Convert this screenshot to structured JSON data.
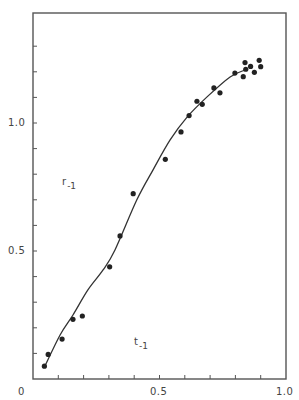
{
  "chart_data": {
    "type": "scatter",
    "title": "",
    "xlabel": "",
    "ylabel": "",
    "xlim": [
      0,
      1.0
    ],
    "ylim": [
      0,
      1.4
    ],
    "grid": false,
    "legend": null,
    "x_tick_labels": [
      {
        "value": 0,
        "label": "0"
      },
      {
        "value": 0.5,
        "label": "0.5"
      },
      {
        "value": 1.0,
        "label": "1.0"
      }
    ],
    "y_tick_labels": [
      {
        "value": 0.5,
        "label": "0.5"
      },
      {
        "value": 1.0,
        "label": "1.0"
      }
    ],
    "x_minor_ticks": [
      0.1,
      0.2,
      0.3,
      0.4,
      0.5,
      0.6,
      0.7,
      0.8,
      0.9
    ],
    "y_minor_ticks": [
      0.1,
      0.2,
      0.3,
      0.4,
      0.5,
      0.6,
      0.7,
      0.8,
      0.9,
      1.0,
      1.1,
      1.2,
      1.3
    ],
    "series": [
      {
        "name": "observed",
        "type": "scatter",
        "points": [
          [
            0.045,
            0.05
          ],
          [
            0.06,
            0.096
          ],
          [
            0.115,
            0.156
          ],
          [
            0.158,
            0.233
          ],
          [
            0.195,
            0.246
          ],
          [
            0.303,
            0.438
          ],
          [
            0.344,
            0.559
          ],
          [
            0.396,
            0.724
          ],
          [
            0.523,
            0.858
          ],
          [
            0.585,
            0.965
          ],
          [
            0.617,
            1.029
          ],
          [
            0.648,
            1.085
          ],
          [
            0.669,
            1.073
          ],
          [
            0.715,
            1.137
          ],
          [
            0.739,
            1.118
          ],
          [
            0.798,
            1.195
          ],
          [
            0.831,
            1.181
          ],
          [
            0.838,
            1.236
          ],
          [
            0.841,
            1.21
          ],
          [
            0.86,
            1.221
          ],
          [
            0.875,
            1.198
          ],
          [
            0.894,
            1.245
          ],
          [
            0.9,
            1.22
          ]
        ]
      },
      {
        "name": "fitted curve",
        "type": "line",
        "points": [
          [
            0.046,
            0.048
          ],
          [
            0.107,
            0.172
          ],
          [
            0.158,
            0.25
          ],
          [
            0.217,
            0.348
          ],
          [
            0.277,
            0.426
          ],
          [
            0.324,
            0.504
          ],
          [
            0.41,
            0.699
          ],
          [
            0.474,
            0.816
          ],
          [
            0.542,
            0.934
          ],
          [
            0.609,
            1.023
          ],
          [
            0.688,
            1.102
          ],
          [
            0.779,
            1.18
          ],
          [
            0.838,
            1.207
          ]
        ]
      }
    ],
    "annotations": [
      {
        "text": "r",
        "subscript": "-1",
        "x": 0.13,
        "y": 0.76
      },
      {
        "text": "t",
        "subscript": "-1",
        "x": 0.415,
        "y": 0.14
      }
    ]
  },
  "labels": {
    "annotation_r": "r",
    "annotation_r_sub": "-1",
    "annotation_t": "t",
    "annotation_t_sub": "-1",
    "x_tick_0": "0",
    "x_tick_05": "0.5",
    "x_tick_10": "1.0",
    "y_tick_05": "0.5",
    "y_tick_10": "1.0"
  },
  "colors": {
    "axis": "#555555",
    "marker": "#222222",
    "curve": "#333333",
    "background": "#ffffff"
  }
}
